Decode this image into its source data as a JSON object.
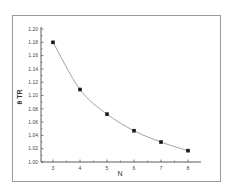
{
  "chart_data": {
    "type": "line",
    "title": "",
    "xlabel": "N",
    "ylabel": "θ TR",
    "x": [
      3,
      4,
      5,
      6,
      7,
      8
    ],
    "series": [
      {
        "name": "θ TR",
        "values": [
          1.18,
          1.109,
          1.072,
          1.047,
          1.03,
          1.017
        ],
        "marker": "square",
        "color": "#1a1a1a",
        "line_color": "#8c8c8c"
      }
    ],
    "xlim": [
      2.6,
      8.5
    ],
    "ylim": [
      1.0,
      1.2
    ],
    "xticks": [
      "3",
      "4",
      "5",
      "6",
      "7",
      "8"
    ],
    "yticks": [
      "1.00",
      "1.02",
      "1.04",
      "1.06",
      "1.08",
      "1.10",
      "1.12",
      "1.14",
      "1.16",
      "1.18",
      "1.20"
    ],
    "grid": false,
    "legend": "none"
  }
}
